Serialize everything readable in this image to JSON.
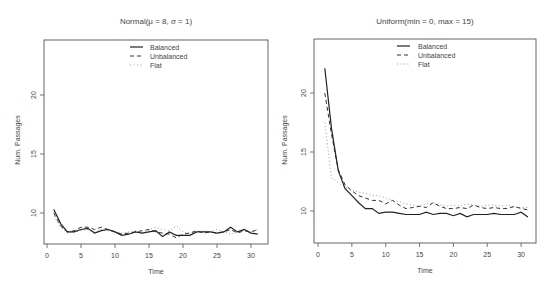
{
  "chart_data": [
    {
      "type": "line",
      "title": "Normal(μ = 8, σ = 1)",
      "xlabel": "Time",
      "ylabel": "Num. Passages",
      "xlim": [
        0,
        31
      ],
      "ylim": [
        7.4,
        25
      ],
      "xticks": [
        0,
        5,
        10,
        15,
        20,
        25,
        30
      ],
      "yticks": [
        10,
        15,
        20
      ],
      "grid": false,
      "legend_position": "top-center",
      "x": [
        1,
        2,
        3,
        4,
        5,
        6,
        7,
        8,
        9,
        10,
        11,
        12,
        13,
        14,
        15,
        16,
        17,
        18,
        19,
        20,
        21,
        22,
        23,
        24,
        25,
        26,
        27,
        28,
        29,
        30,
        31
      ],
      "series": [
        {
          "name": "Balanced",
          "style": "solid",
          "values": [
            10.3,
            9.1,
            8.4,
            8.4,
            8.6,
            8.7,
            8.3,
            8.5,
            8.6,
            8.4,
            8.1,
            8.2,
            8.4,
            8.3,
            8.4,
            8.5,
            8.0,
            8.4,
            8.1,
            8.1,
            8.1,
            8.4,
            8.4,
            8.4,
            8.3,
            8.4,
            8.8,
            8.4,
            8.6,
            8.3,
            8.2
          ]
        },
        {
          "name": "Unbalanced",
          "style": "dashed",
          "values": [
            10.0,
            8.9,
            8.4,
            8.5,
            8.8,
            8.8,
            8.6,
            8.8,
            8.6,
            8.4,
            8.2,
            8.3,
            8.4,
            8.5,
            8.6,
            8.4,
            8.3,
            8.2,
            7.9,
            8.2,
            8.3,
            8.5,
            8.3,
            8.4,
            8.3,
            8.4,
            8.6,
            8.3,
            8.5,
            8.4,
            8.6
          ]
        },
        {
          "name": "Flat",
          "style": "dotted",
          "values": [
            9.7,
            8.8,
            8.3,
            8.4,
            8.5,
            8.6,
            8.4,
            8.6,
            8.5,
            8.4,
            8.3,
            8.4,
            8.5,
            8.3,
            8.6,
            8.8,
            8.6,
            8.5,
            8.9,
            8.4,
            8.3,
            8.4,
            8.5,
            8.4,
            8.6,
            8.4,
            8.2,
            8.4,
            8.5,
            8.4,
            8.6
          ]
        }
      ]
    },
    {
      "type": "line",
      "title": "Uniform(min = 0, max = 15)",
      "xlabel": "Time",
      "ylabel": "Num. Passages",
      "xlim": [
        0,
        31
      ],
      "ylim": [
        7.4,
        25
      ],
      "xticks": [
        0,
        5,
        10,
        15,
        20,
        25,
        30
      ],
      "yticks": [
        10,
        15,
        20
      ],
      "grid": false,
      "legend_position": "top-center",
      "x": [
        1,
        2,
        3,
        4,
        5,
        6,
        7,
        8,
        9,
        10,
        11,
        12,
        13,
        14,
        15,
        16,
        17,
        18,
        19,
        20,
        21,
        22,
        23,
        24,
        25,
        26,
        27,
        28,
        29,
        30,
        31
      ],
      "series": [
        {
          "name": "Balanced",
          "style": "solid",
          "values": [
            22.1,
            17.0,
            13.4,
            11.9,
            11.3,
            10.7,
            10.2,
            10.2,
            9.8,
            9.9,
            9.9,
            9.8,
            9.7,
            9.7,
            9.7,
            9.9,
            9.7,
            9.8,
            9.8,
            9.6,
            9.8,
            9.5,
            9.7,
            9.7,
            9.7,
            9.8,
            9.7,
            9.7,
            9.7,
            9.9,
            9.5
          ]
        },
        {
          "name": "Unbalanced",
          "style": "dashed",
          "values": [
            20.0,
            16.5,
            13.5,
            12.2,
            11.7,
            11.3,
            11.1,
            10.9,
            10.9,
            10.6,
            10.9,
            10.5,
            10.2,
            10.3,
            10.4,
            10.3,
            10.7,
            10.4,
            10.2,
            10.2,
            10.3,
            10.2,
            10.5,
            10.3,
            10.2,
            10.3,
            10.2,
            10.2,
            10.4,
            10.2,
            10.1
          ]
        },
        {
          "name": "Flat",
          "style": "dotted",
          "values": [
            17.5,
            12.8,
            12.4,
            12.0,
            11.8,
            11.6,
            11.5,
            11.3,
            11.3,
            11.1,
            10.9,
            10.8,
            10.6,
            10.5,
            10.4,
            10.6,
            10.7,
            10.5,
            10.4,
            10.5,
            10.4,
            10.6,
            10.5,
            10.4,
            10.5,
            10.5,
            10.4,
            10.5,
            10.3,
            10.3,
            10.3
          ]
        }
      ]
    }
  ],
  "panels": [
    {
      "title": "Normal(μ = 8, σ = 1)",
      "xlabel": "Time",
      "ylabel": "Num. Passages",
      "legend": [
        "Balanced",
        "Unbalanced",
        "Flat"
      ],
      "xtick_labels": [
        "0",
        "5",
        "10",
        "15",
        "20",
        "25",
        "30"
      ],
      "ytick_labels": [
        "10",
        "15",
        "20"
      ]
    },
    {
      "title": "Uniform(min = 0, max = 15)",
      "xlabel": "Time",
      "ylabel": "Num. Passages",
      "legend": [
        "Balanced",
        "Unbalanced",
        "Flat"
      ],
      "xtick_labels": [
        "0",
        "5",
        "10",
        "15",
        "20",
        "25",
        "30"
      ],
      "ytick_labels": [
        "10",
        "15",
        "20"
      ]
    }
  ]
}
